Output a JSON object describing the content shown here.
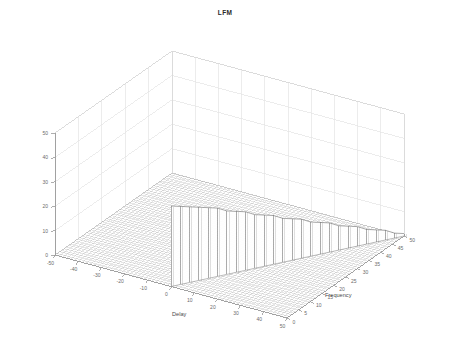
{
  "figure": {
    "title": "LFM",
    "background_color": "#ffffff",
    "box_line_color": "#d9d9d9",
    "grid_line_color": "#e4e4e4",
    "mesh_color": "#808080",
    "tick_color": "#6b6b6b"
  },
  "axes": {
    "x": {
      "name": "Delay",
      "ticks": [
        "-50",
        "-40",
        "-30",
        "-20",
        "-10",
        "0",
        "10",
        "20",
        "30",
        "40",
        "50"
      ],
      "min": -50,
      "max": 50
    },
    "y": {
      "name": "Frequency",
      "ticks": [
        "0",
        "5",
        "10",
        "15",
        "20",
        "25",
        "30",
        "35",
        "40",
        "45",
        "50"
      ],
      "min": 0,
      "max": 50
    },
    "z": {
      "name": "",
      "ticks": [
        "0",
        "10",
        "20",
        "30",
        "40",
        "50"
      ],
      "min": 0,
      "max": 50
    }
  },
  "chart_data": {
    "type": "line",
    "plot_style": "3d-mesh-surface",
    "title": "LFM",
    "xlabel": "Delay",
    "ylabel": "Frequency",
    "zlabel": "",
    "xlim": [
      -50,
      50
    ],
    "ylim": [
      0,
      50
    ],
    "zlim": [
      0,
      50
    ],
    "grid": true,
    "legend_position": "none",
    "x_tick_labels": [
      "-50",
      "-40",
      "-30",
      "-20",
      "-10",
      "0",
      "10",
      "20",
      "30",
      "40",
      "50"
    ],
    "y_tick_labels": [
      "0",
      "5",
      "10",
      "15",
      "20",
      "25",
      "30",
      "35",
      "40",
      "45",
      "50"
    ],
    "z_tick_labels": [
      "0",
      "10",
      "20",
      "30",
      "40",
      "50"
    ],
    "ridge": {
      "frequency_values": [
        0,
        2,
        4,
        6,
        8,
        10,
        12,
        14,
        16,
        18,
        20,
        22,
        24,
        26,
        28,
        30,
        32,
        34,
        36,
        38,
        40,
        42,
        44,
        46,
        48,
        50
      ],
      "peak_heights": [
        33,
        32,
        31,
        30,
        29,
        28,
        26,
        25,
        24,
        22,
        21,
        20,
        18,
        17,
        16,
        14,
        13,
        12,
        10,
        9,
        8,
        6,
        5,
        4,
        2,
        1
      ],
      "delay_of_peak": [
        0,
        2,
        4,
        6,
        8,
        10,
        12,
        14,
        16,
        18,
        20,
        22,
        24,
        26,
        28,
        30,
        32,
        34,
        36,
        38,
        40,
        42,
        44,
        46,
        48,
        50
      ]
    },
    "baseline_value": 0
  }
}
